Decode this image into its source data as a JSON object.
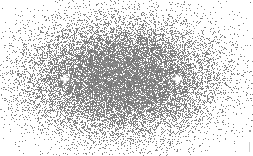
{
  "figure": {
    "type": "stippled-density",
    "width": 253,
    "height": 156,
    "background": "#ffffff",
    "dot_color": "#7a7a7a",
    "center": [
      121,
      78
    ],
    "radii": [
      120,
      73
    ],
    "foci": [
      {
        "label": "focus-left",
        "x": 65,
        "y": 79
      },
      {
        "label": "focus-right",
        "x": 177,
        "y": 79
      }
    ],
    "marker_color": "#ffffff",
    "marker_shape": "plus"
  }
}
